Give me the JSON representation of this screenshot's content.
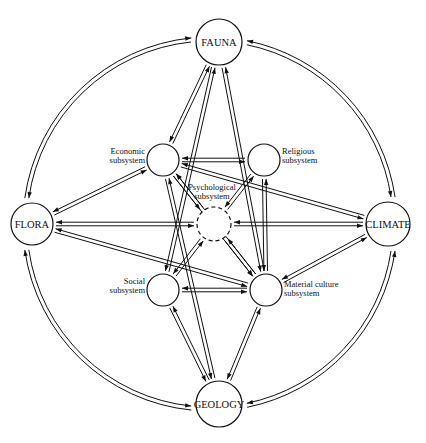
{
  "diagram": {
    "title_fragment": "",
    "nodes": [
      {
        "id": "fauna",
        "label": "FAUNA",
        "lines": [
          "FAUNA"
        ],
        "cx": 219,
        "cy": 42,
        "r": 23,
        "type": "environment"
      },
      {
        "id": "flora",
        "label": "FLORA",
        "lines": [
          "FLORA"
        ],
        "cx": 32,
        "cy": 224,
        "r": 21,
        "type": "environment"
      },
      {
        "id": "climate",
        "label": "CLIMATE",
        "lines": [
          "CLIMATE"
        ],
        "cx": 388,
        "cy": 224,
        "r": 22,
        "type": "environment"
      },
      {
        "id": "geology",
        "label": "GEOLOGY",
        "lines": [
          "GEOLOGY"
        ],
        "cx": 219,
        "cy": 404,
        "r": 23,
        "type": "environment"
      },
      {
        "id": "economic",
        "label": "Economic subsystem",
        "lines": [
          "Economic",
          "subsystem"
        ],
        "cx": 163,
        "cy": 160,
        "r": 16,
        "type": "subsystem"
      },
      {
        "id": "religious",
        "label": "Religious subsystem",
        "lines": [
          "Religious",
          "subsystem"
        ],
        "cx": 264,
        "cy": 160,
        "r": 16,
        "type": "subsystem"
      },
      {
        "id": "psychological",
        "label": "Psychological subsystem",
        "lines": [
          "Psychological",
          "subsystem"
        ],
        "cx": 214,
        "cy": 224,
        "r": 17,
        "type": "subsystem-dashed"
      },
      {
        "id": "social",
        "label": "Social subsystem",
        "lines": [
          "Social",
          "subsystem"
        ],
        "cx": 163,
        "cy": 290,
        "r": 16,
        "type": "subsystem"
      },
      {
        "id": "material",
        "label": "Material culture subsystem",
        "lines": [
          "Material culture",
          "subsystem"
        ],
        "cx": 266,
        "cy": 290,
        "r": 16,
        "type": "subsystem"
      }
    ],
    "outer_links": [
      {
        "from": "fauna",
        "to": "flora"
      },
      {
        "from": "fauna",
        "to": "climate"
      },
      {
        "from": "flora",
        "to": "geology"
      },
      {
        "from": "climate",
        "to": "geology"
      }
    ],
    "inner_links": [
      {
        "from": "fauna",
        "to": "economic"
      },
      {
        "from": "fauna",
        "to": "social"
      },
      {
        "from": "fauna",
        "to": "material"
      },
      {
        "from": "flora",
        "to": "economic"
      },
      {
        "from": "flora",
        "to": "psychological"
      },
      {
        "from": "flora",
        "to": "material"
      },
      {
        "from": "climate",
        "to": "economic"
      },
      {
        "from": "climate",
        "to": "psychological"
      },
      {
        "from": "climate",
        "to": "material"
      },
      {
        "from": "geology",
        "to": "economic"
      },
      {
        "from": "geology",
        "to": "social"
      },
      {
        "from": "geology",
        "to": "material"
      },
      {
        "from": "economic",
        "to": "religious"
      },
      {
        "from": "economic",
        "to": "psychological"
      },
      {
        "from": "religious",
        "to": "psychological"
      },
      {
        "from": "social",
        "to": "psychological"
      },
      {
        "from": "material",
        "to": "psychological"
      },
      {
        "from": "social",
        "to": "material"
      },
      {
        "from": "religious",
        "to": "material"
      },
      {
        "from": "economic",
        "to": "material"
      }
    ]
  }
}
